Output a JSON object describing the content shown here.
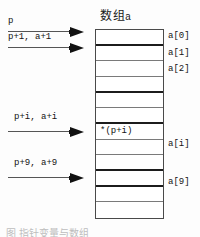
{
  "figure": {
    "title_main": "数组",
    "title_sub": "a",
    "caption_partial": "图        指针变量与数组"
  },
  "array": {
    "cells": [
      {
        "text": "",
        "divider": "thick"
      },
      {
        "text": "",
        "divider": "thin"
      },
      {
        "text": "",
        "divider": "thin"
      },
      {
        "text": "",
        "divider": "thick"
      },
      {
        "text": "",
        "divider": "thin"
      },
      {
        "text": "",
        "divider": "thick"
      },
      {
        "text": "*(p+i)",
        "divider": "thin"
      },
      {
        "text": "",
        "divider": "thin"
      },
      {
        "text": "",
        "divider": "thick"
      },
      {
        "text": "",
        "divider": "thick"
      },
      {
        "text": "",
        "divider": "thin"
      },
      {
        "text": "",
        "divider": "none"
      }
    ],
    "index_labels": [
      {
        "text": "a[0]",
        "top": 31
      },
      {
        "text": "a[1]",
        "top": 48
      },
      {
        "text": "a[2]",
        "top": 64
      },
      {
        "text": "a[i]",
        "top": 139
      },
      {
        "text": "a[9]",
        "top": 177
      }
    ]
  },
  "pointers": [
    {
      "label": "p",
      "label_left": 8,
      "label_top": 16,
      "line_top": 31,
      "line_left": 8,
      "line_width": 62
    },
    {
      "label": "p+1, a+1",
      "label_left": 8,
      "label_top": 32,
      "line_top": 47,
      "line_left": 8,
      "line_width": 62
    },
    {
      "label": "p+i, a+i",
      "label_left": 14,
      "label_top": 112,
      "line_top": 131,
      "line_left": 8,
      "line_width": 62
    },
    {
      "label": "p+9, a+9",
      "label_left": 14,
      "label_top": 158,
      "line_top": 177,
      "line_left": 8,
      "line_width": 62
    }
  ],
  "colors": {
    "box_border": "#4a4a4a",
    "divider_thin": "#7a7a7a",
    "divider_thick": "#1c1c1c",
    "arrow": "#111111",
    "text": "#141414",
    "background": "#fdfdfd"
  }
}
